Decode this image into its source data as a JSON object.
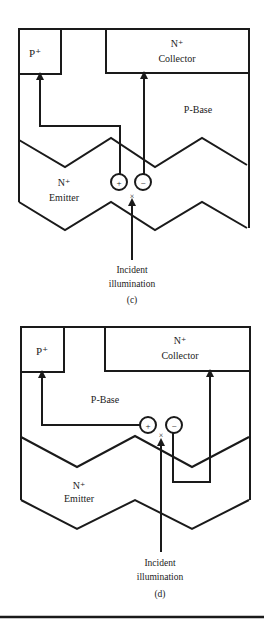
{
  "figures": [
    {
      "id": "c",
      "caption": "(c)",
      "labels": {
        "p_plus": "P⁺",
        "collector_sup": "N⁺",
        "collector": "Collector",
        "base": "P-Base",
        "emitter_sup": "N⁺",
        "emitter": "Emitter",
        "plus": "+",
        "minus": "−",
        "cross": "×",
        "illum_line1": "Incident",
        "illum_line2": "illumination"
      }
    },
    {
      "id": "d",
      "caption": "(d)",
      "labels": {
        "p_plus": "P⁺",
        "collector_sup": "N⁺",
        "collector": "Collector",
        "base": "P-Base",
        "emitter_sup": "N⁺",
        "emitter": "Emitter",
        "plus": "+",
        "minus": "−",
        "cross": "×",
        "illum_line1": "Incident",
        "illum_line2": "illumination"
      }
    }
  ],
  "colors": {
    "stroke": "#1a1a1a",
    "background": "#ffffff"
  }
}
